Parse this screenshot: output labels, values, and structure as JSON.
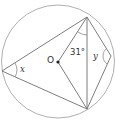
{
  "diagram": {
    "type": "circle-geometry",
    "circle": {
      "cx": 58,
      "cy": 61.5,
      "r": 56.5,
      "stroke": "#9a9a9a"
    },
    "center_label": "O",
    "points": {
      "top": [
        87,
        17
      ],
      "left": [
        2,
        71
      ],
      "bottom": [
        87,
        109
      ],
      "right": [
        111,
        56
      ],
      "center": [
        58,
        62
      ]
    },
    "angle_labels": {
      "x": "x",
      "y": "y",
      "given": "31°"
    },
    "line_color": "#6e6e6e"
  }
}
